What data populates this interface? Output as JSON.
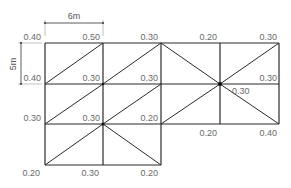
{
  "dimensions": {
    "horizontal": {
      "label": "6m"
    },
    "vertical": {
      "label": "5m"
    }
  },
  "grid": {
    "columns_x": [
      45,
      103,
      161,
      220,
      279
    ],
    "rows_y": [
      43,
      84,
      124,
      165
    ]
  },
  "node_labels": {
    "row0": [
      "0.40",
      "0.50",
      "0.30",
      "0.20",
      "0.30"
    ],
    "row1": [
      "0.40",
      "0.30",
      "0.30",
      "0.30",
      "0.30"
    ],
    "row2": [
      "0.30",
      "0.30",
      "0.20",
      "0.20",
      "0.40"
    ],
    "row3": [
      "0.20",
      "0.30",
      "0.20"
    ]
  },
  "colors": {
    "line": "#2a2a2a",
    "label": "#6a6a6a"
  }
}
